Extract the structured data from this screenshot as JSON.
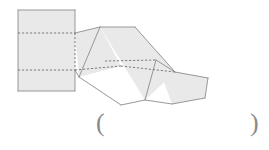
{
  "figure": {
    "colors": {
      "fill": "#e9e9e9",
      "stroke": "#8c8c8c",
      "dash": "#6e6e6e",
      "background": "#ffffff",
      "paren": "#8a8a8a"
    },
    "stroke_width": 0.9,
    "dash_pattern": "2.2 1.8",
    "panels": [
      {
        "name": "panel-1-front-rectangle",
        "points": "18,10 75,10 75,91 18,91"
      },
      {
        "name": "panel-2-tilted",
        "points": "75,33 100,27 121,66 79,77"
      },
      {
        "name": "panel-3-tilted",
        "points": "100,27 135,27 175,72 145,100"
      },
      {
        "name": "panel-4-end-pentagon",
        "points": "156,60 175,72 208,78 205,98 172,104"
      }
    ],
    "fold_lines": [
      {
        "name": "fold-line-upper-horizontal",
        "points": "18,33 75,33"
      },
      {
        "name": "fold-line-lower-horizontal",
        "points": "18,70 75,70"
      },
      {
        "name": "fold-line-panel2-vertical",
        "points": "75,33 75,70"
      },
      {
        "name": "fold-line-panel2-diagonal",
        "points": "75,70 121,66"
      },
      {
        "name": "fold-line-panel3-diagonal",
        "points": "105,61 156,60"
      },
      {
        "name": "fold-line-panel3-to-4",
        "points": "121,66 175,72"
      }
    ],
    "solid_edges": [
      {
        "name": "edge-panel1-top",
        "points": "18,10 75,10"
      },
      {
        "name": "edge-panel1-left",
        "points": "18,10 18,91"
      },
      {
        "name": "edge-panel1-bottom",
        "points": "18,91 75,91"
      },
      {
        "name": "edge-panel1-right-upper",
        "points": "75,10 75,33"
      },
      {
        "name": "edge-panel1-right-lower",
        "points": "75,70 75,91"
      },
      {
        "name": "edge-panel2-top",
        "points": "75,33 100,27"
      },
      {
        "name": "edge-panel2-bottom",
        "points": "75,70 79,77"
      },
      {
        "name": "edge-panel2-lower-left",
        "points": "79,77 121,105"
      },
      {
        "name": "edge-panel3-top",
        "points": "100,27 135,27"
      },
      {
        "name": "edge-panel3-right",
        "points": "135,27 175,72"
      },
      {
        "name": "edge-panel3-bottom",
        "points": "121,105 145,100"
      },
      {
        "name": "edge-panel3-left-diag",
        "points": "100,27 79,77"
      },
      {
        "name": "edge-panel3-bottom-right",
        "points": "145,100 156,60"
      },
      {
        "name": "edge-panel4-top",
        "points": "156,60 175,72"
      },
      {
        "name": "edge-panel4-upper-right",
        "points": "175,72 208,78"
      },
      {
        "name": "edge-panel4-right",
        "points": "208,78 205,98"
      },
      {
        "name": "edge-panel4-bottom",
        "points": "205,98 172,104"
      },
      {
        "name": "edge-panel4-left",
        "points": "172,104 145,100"
      }
    ]
  },
  "answer": {
    "open_paren": "(",
    "close_paren": ")",
    "value": "",
    "placeholder": ""
  }
}
